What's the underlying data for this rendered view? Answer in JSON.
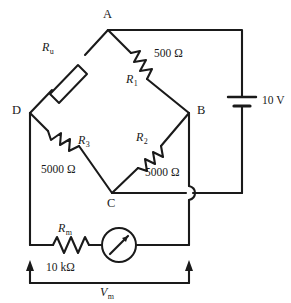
{
  "figure": {
    "type": "circuit-schematic"
  },
  "nodes": [
    {
      "id": "A",
      "label": "A",
      "x": 108,
      "y": 30
    },
    {
      "id": "B",
      "label": "B",
      "x": 189,
      "y": 113
    },
    {
      "id": "C",
      "label": "C",
      "x": 112,
      "y": 193
    },
    {
      "id": "D",
      "label": "D",
      "x": 30,
      "y": 113
    }
  ],
  "components": {
    "unknown_resistor": {
      "name": "R",
      "subscript": "u",
      "style": "box"
    },
    "r1": {
      "name": "R",
      "subscript": "1",
      "value": "500 Ω",
      "style": "zigzag"
    },
    "r2": {
      "name": "R",
      "subscript": "2",
      "value": "5000 Ω",
      "style": "zigzag"
    },
    "r3": {
      "name": "R",
      "subscript": "3",
      "value": "5000 Ω",
      "style": "zigzag"
    },
    "rm": {
      "name": "R",
      "subscript": "m",
      "value": "10 kΩ",
      "style": "zigzag"
    },
    "battery": {
      "value": "10 V",
      "style": "single-cell"
    },
    "meter": {
      "style": "circle-with-needle"
    }
  },
  "measurement": {
    "name": "V",
    "subscript": "m",
    "style": "dimension-arrows"
  },
  "colors": {
    "line": "#1a1a1a",
    "background": "#ffffff",
    "text": "#1a1a1a"
  }
}
